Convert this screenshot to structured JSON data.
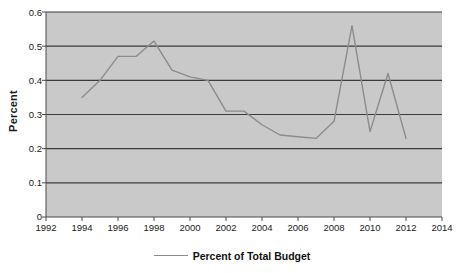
{
  "chart_data": {
    "type": "line",
    "title": "",
    "xlabel": "",
    "ylabel": "Percent",
    "xlim": [
      1992,
      2014
    ],
    "ylim": [
      0,
      0.6
    ],
    "grid": true,
    "legend_position": "bottom",
    "x_ticks": [
      "1992",
      "1994",
      "1996",
      "1998",
      "2000",
      "2002",
      "2004",
      "2006",
      "2008",
      "2010",
      "2012",
      "2014"
    ],
    "y_ticks": [
      "0",
      "0.1",
      "0.2",
      "0.3",
      "0.4",
      "0.5",
      "0.6"
    ],
    "series": [
      {
        "name": "Percent of Total Budget",
        "color": "#8c8c8c",
        "x": [
          1994,
          1995,
          1996,
          1997,
          1998,
          1999,
          2000,
          2001,
          2002,
          2003,
          2004,
          2005,
          2006,
          2007,
          2008,
          2009,
          2010,
          2011,
          2012
        ],
        "values": [
          0.35,
          0.4,
          0.47,
          0.47,
          0.515,
          0.43,
          0.41,
          0.4,
          0.31,
          0.31,
          0.27,
          0.24,
          0.235,
          0.23,
          0.28,
          0.56,
          0.25,
          0.42,
          0.23
        ]
      }
    ],
    "legend": [
      "Percent of Total Budget"
    ],
    "plot_background": "#c9c9c9",
    "gridline_color": "#3a3a3a"
  }
}
